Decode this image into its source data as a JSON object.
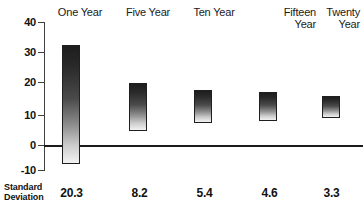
{
  "chart_data": {
    "type": "bar",
    "title": "",
    "subtitle": "",
    "xlabel": "",
    "ylabel": "",
    "ylim": [
      -10,
      40
    ],
    "yticks": [
      40,
      30,
      20,
      10,
      0,
      -10
    ],
    "ytick_labels": [
      "40",
      "30",
      "20",
      "10",
      "0",
      "-10"
    ],
    "grid": false,
    "legend": "none",
    "zero_line": 0,
    "categories": [
      "One Year",
      "Five Year",
      "Fifteen Year",
      "Twenty Year",
      "Ten Year"
    ],
    "bars": [
      {
        "label": "One Year",
        "low": -8.0,
        "high": 32.3,
        "std_dev": "20.3"
      },
      {
        "label": "Five Year",
        "low": 3.3,
        "high": 19.3,
        "std_dev": "8.2"
      },
      {
        "label": "Ten Year",
        "low": 6.0,
        "high": 17.0,
        "std_dev": "5.4"
      },
      {
        "label": "Fifteen Year",
        "low": 6.5,
        "high": 16.5,
        "std_dev": "4.6"
      },
      {
        "label": "Twenty Year",
        "low": 7.7,
        "high": 15.0,
        "std_dev": "3.3"
      }
    ],
    "series": [
      {
        "name": "range-low",
        "values": [
          -8.0,
          3.3,
          6.0,
          6.5,
          7.7
        ]
      },
      {
        "name": "range-high",
        "values": [
          32.3,
          19.3,
          17.0,
          16.5,
          15.0
        ]
      }
    ],
    "annotations": {
      "row_label": "Standard\nDeviation",
      "row_values": [
        "20.3",
        "8.2",
        "5.4",
        "4.6",
        "3.3"
      ]
    },
    "colors": {
      "bar_gradient_top": "#1d1d1d",
      "bar_gradient_bottom": "#f2f2f2",
      "bar_border": "#1f1f1f",
      "axis": "#404040",
      "zero_line": "#1a1a1a",
      "text": "#111111",
      "background": "#ffffff"
    }
  },
  "headers": [
    {
      "text": "One Year"
    },
    {
      "text": "Five Year"
    },
    {
      "text": "Ten Year"
    },
    {
      "text": "Fifteen\nYear"
    },
    {
      "text": "Twenty\nYear"
    }
  ],
  "axis": {
    "labels": [
      "40",
      "30",
      "20",
      "10",
      "0",
      "-10"
    ]
  },
  "footer": {
    "label_line1": "Standard",
    "label_line2": "Deviation",
    "values": [
      "20.3",
      "8.2",
      "5.4",
      "4.6",
      "3.3"
    ]
  }
}
